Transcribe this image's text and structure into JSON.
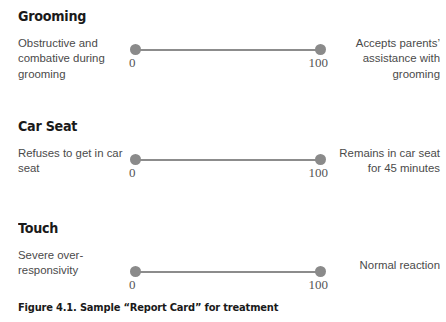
{
  "figure": {
    "caption": "Figure 4.1. Sample “Report Card” for treatment",
    "scale_color": "#8a8a8a",
    "text_color": "#4a4a4a",
    "heading_color": "#1a1a1a",
    "background": "#ffffff"
  },
  "sections": [
    {
      "heading": "Grooming",
      "left_anchor": "Obstructive and combative during grooming",
      "right_anchor": "Accepts parents’ assistance with grooming",
      "scale_min_label": "0",
      "scale_max_label": "100",
      "scale_min": 0,
      "scale_max": 100
    },
    {
      "heading": "Car Seat",
      "left_anchor": "Refuses to get in car seat",
      "right_anchor": "Remains in car seat for 45 minutes",
      "scale_min_label": "0",
      "scale_max_label": "100",
      "scale_min": 0,
      "scale_max": 100
    },
    {
      "heading": "Touch",
      "left_anchor": "Severe over-responsivity",
      "right_anchor": "Normal reaction",
      "scale_min_label": "0",
      "scale_max_label": "100",
      "scale_min": 0,
      "scale_max": 100
    }
  ]
}
